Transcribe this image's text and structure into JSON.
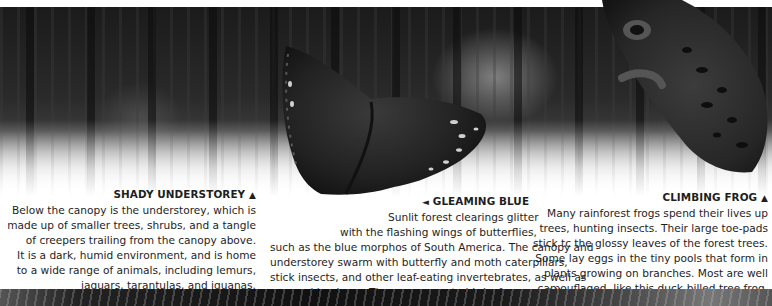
{
  "sections": {
    "shady_understorey": {
      "heading": "SHADY UNDERSTOREY",
      "marker": "▲",
      "lines": [
        "Below the canopy is the understorey, which is",
        "made up of smaller trees, shrubs, and a tangle",
        "of creepers trailing from the canopy above.",
        "It is a dark, humid environment, and is home",
        "to a wide range of animals, including lemurs,",
        "jaguars, tarantulas, and iguanas."
      ]
    },
    "gleaming_blue": {
      "heading": "GLEAMING BLUE",
      "marker": "◄",
      "lines": [
        "Sunlit forest clearings glitter",
        "with the flashing wings of butterflies,",
        "such as the blue morphos of South America. The canopy and",
        "understorey swarm with butterfly and moth caterpillars,",
        "stick insects, and other leaf-eating invertebrates, as well as",
        "sap-sucking bugs. These are prey to birds, frogs, and lizards."
      ]
    },
    "climbing_frog": {
      "heading": "CLIMBING FROG",
      "marker": "▲",
      "lines": [
        "Many rainforest frogs spend their lives up",
        "trees, hunting insects. Their large toe-pads",
        "stick tc the glossy leaves of the forest trees.",
        "Some lay eggs in the tiny pools that form in",
        "plants growing on branches. Most are well",
        "camouflaged, like this duck-billed tree frog."
      ]
    }
  },
  "images": {
    "background": "rainforest-understorey-photo",
    "butterfly": "blue-morpho-butterfly-photo",
    "frog": "duck-billed-tree-frog-photo",
    "foliage": "foliage-strip-photo"
  }
}
